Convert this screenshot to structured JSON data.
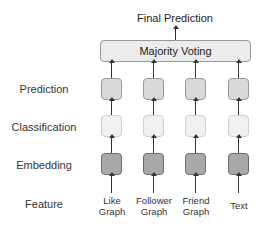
{
  "diagram": {
    "output_label": "Final Prediction",
    "aggregator_label": "Majority Voting",
    "row_labels": {
      "prediction": "Prediction",
      "classification": "Classification",
      "embedding": "Embedding",
      "feature": "Feature"
    },
    "features": [
      {
        "line1": "Like",
        "line2": "Graph"
      },
      {
        "line1": "Follower",
        "line2": "Graph"
      },
      {
        "line1": "Friend",
        "line2": "Graph"
      },
      {
        "line1": "Text",
        "line2": ""
      }
    ],
    "colors": {
      "prediction_box": "#d9d9d9",
      "classification_box": "#f0f0f0",
      "embedding_box": "#a8a8a8",
      "aggregator_box": "#ececec"
    }
  }
}
